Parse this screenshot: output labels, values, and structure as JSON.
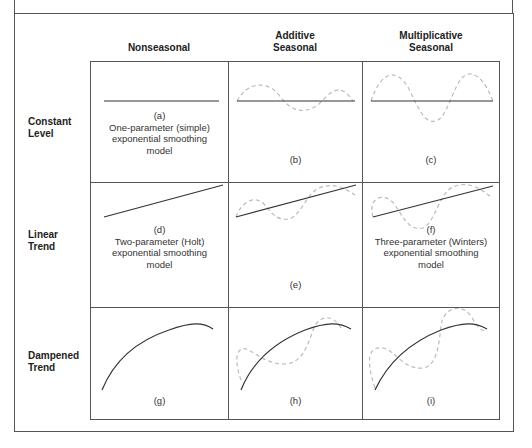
{
  "diagram": {
    "columns": [
      {
        "id": "nonseasonal",
        "label_lines": [
          "Nonseasonal"
        ]
      },
      {
        "id": "additive",
        "label_lines": [
          "Additive",
          "Seasonal"
        ]
      },
      {
        "id": "multiplicative",
        "label_lines": [
          "Multiplicative",
          "Seasonal"
        ]
      }
    ],
    "rows": [
      {
        "id": "constant",
        "label_lines": [
          "Constant",
          "Level"
        ]
      },
      {
        "id": "linear",
        "label_lines": [
          "Linear",
          "Trend"
        ]
      },
      {
        "id": "dampened",
        "label_lines": [
          "Dampened",
          "Trend"
        ]
      }
    ],
    "cells": {
      "a": {
        "letter": "(a)",
        "desc": [
          "One-parameter (simple)",
          "exponential smoothing",
          "model"
        ]
      },
      "b": {
        "letter": "(b)",
        "desc": []
      },
      "c": {
        "letter": "(c)",
        "desc": []
      },
      "d": {
        "letter": "(d)",
        "desc": [
          "Two-parameter (Holt)",
          "exponential smoothing",
          "model"
        ]
      },
      "e": {
        "letter": "(e)",
        "desc": []
      },
      "f": {
        "letter": "(f)",
        "desc": [
          "Three-parameter (Winters)",
          "exponential smoothing",
          "model"
        ]
      },
      "g": {
        "letter": "(g)",
        "desc": []
      },
      "h": {
        "letter": "(h)",
        "desc": []
      },
      "i": {
        "letter": "(i)",
        "desc": []
      }
    },
    "colors": {
      "trend_line": "#333333",
      "seasonal_dashed": "#bbbbbb",
      "border": "#555555"
    }
  }
}
